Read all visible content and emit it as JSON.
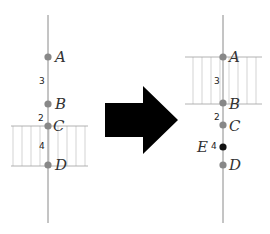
{
  "diagram": {
    "type": "number-line interval transformation",
    "colors": {
      "line": "#8a8a8a",
      "point": "#888888",
      "point_new": "#111111",
      "hatch": "#bdbdbd",
      "band_edge": "#9a9a9a",
      "arrow": "#000000"
    },
    "before": {
      "points": [
        {
          "label": "A",
          "y": 57
        },
        {
          "label": "B",
          "y": 104
        },
        {
          "label": "C",
          "y": 126
        },
        {
          "label": "D",
          "y": 165
        }
      ],
      "gaps": [
        {
          "value": "3",
          "between": "A-B"
        },
        {
          "value": "2",
          "between": "B-C"
        },
        {
          "value": "4",
          "between": "C-D"
        }
      ],
      "highlighted_interval": "C-D"
    },
    "arrow": {
      "direction": "right"
    },
    "after": {
      "points": [
        {
          "label": "A",
          "y": 57
        },
        {
          "label": "B",
          "y": 103
        },
        {
          "label": "C",
          "y": 125
        },
        {
          "label": "E",
          "y": 147,
          "new": true
        },
        {
          "label": "D",
          "y": 165
        }
      ],
      "gaps": [
        {
          "value": "3",
          "between": "A-B"
        },
        {
          "value": "2",
          "between": "B-C"
        },
        {
          "value": "4",
          "between": "E"
        }
      ],
      "highlighted_interval": "A-B"
    }
  }
}
